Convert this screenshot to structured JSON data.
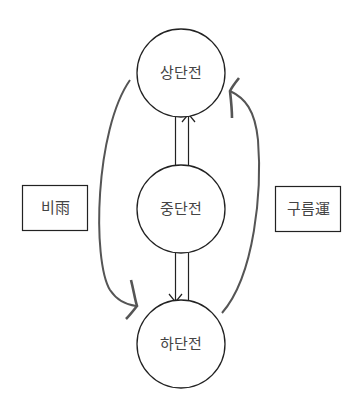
{
  "diagram": {
    "nodes": [
      {
        "id": "top",
        "label": "상단전"
      },
      {
        "id": "middle",
        "label": "중단전"
      },
      {
        "id": "bottom",
        "label": "하단전"
      }
    ],
    "side_labels": {
      "left": "비雨",
      "right": "구름運"
    },
    "edges": [
      {
        "from": "middle",
        "to": "top",
        "style": "double-line-arrow"
      },
      {
        "from": "middle",
        "to": "bottom",
        "style": "double-line-arrow"
      },
      {
        "from": "top",
        "to": "bottom",
        "side": "left",
        "style": "curved-arrow",
        "label_ref": "left"
      },
      {
        "from": "bottom",
        "to": "top",
        "side": "right",
        "style": "curved-arrow",
        "label_ref": "right"
      }
    ],
    "colors": {
      "line": "#222222",
      "curve": "#555555",
      "text": "#444444"
    }
  }
}
